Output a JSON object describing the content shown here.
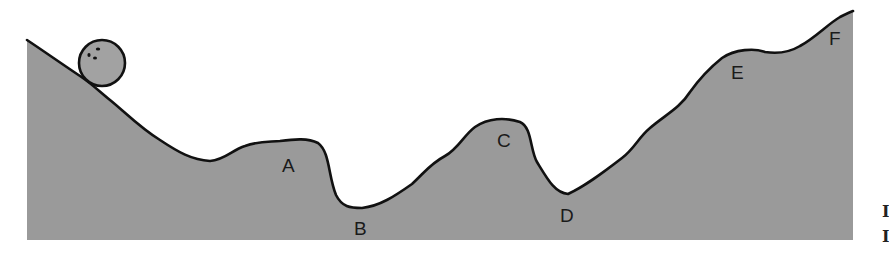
{
  "diagram": {
    "type": "terrain-profile",
    "colors": {
      "terrain_fill": "#9a9a9a",
      "outline": "#111111",
      "ball_fill": "#a2a2a2",
      "background": "#ffffff",
      "label": "#1a1a1a"
    },
    "points": [
      {
        "id": "A",
        "label": "A",
        "x": 290,
        "y": 167,
        "feature": "plateau"
      },
      {
        "id": "B",
        "label": "B",
        "x": 363,
        "y": 230,
        "feature": "valley"
      },
      {
        "id": "C",
        "label": "C",
        "x": 507,
        "y": 142,
        "feature": "peak"
      },
      {
        "id": "D",
        "label": "D",
        "x": 568,
        "y": 217,
        "feature": "valley"
      },
      {
        "id": "E",
        "label": "E",
        "x": 739,
        "y": 74,
        "feature": "plateau"
      },
      {
        "id": "F",
        "label": "F",
        "x": 836,
        "y": 40,
        "feature": "summit"
      }
    ],
    "ball": {
      "cx": 102,
      "cy": 63,
      "r": 23
    },
    "edge_glyphs": [
      "I",
      "I"
    ]
  }
}
